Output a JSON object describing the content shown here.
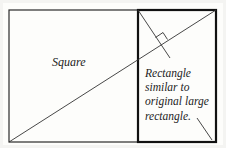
{
  "diagram": {
    "labels": {
      "square": "Square",
      "rectangle_lines": [
        "Rectangle",
        "similar to",
        "original large",
        "rectangle."
      ]
    },
    "colors": {
      "stroke": "#1a1a1a",
      "background": "#fdfdfb"
    },
    "geometry": {
      "outer_rect": {
        "x1": 9,
        "y1": 10,
        "x2": 216,
        "y2": 142
      },
      "divider_x": 138,
      "diagonal": {
        "x1": 9,
        "y1": 142,
        "x2": 216,
        "y2": 10
      },
      "perpendicular": {
        "x1": 138,
        "y1": 10,
        "x2": 170,
        "y2": 58
      },
      "right_angle_marker_at": {
        "x": 161,
        "y": 46
      },
      "pointer_line": {
        "x1": 197,
        "y1": 118,
        "x2": 212,
        "y2": 140
      }
    }
  }
}
